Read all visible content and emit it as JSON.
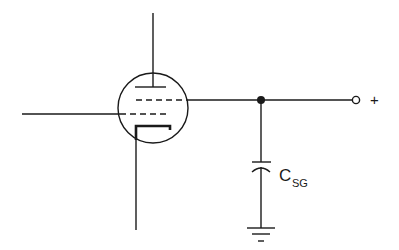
{
  "diagram": {
    "type": "circuit-schematic",
    "components": [
      {
        "id": "tube",
        "kind": "vacuum-tube-tetrode",
        "elements": [
          "plate",
          "screen-grid",
          "control-grid",
          "cathode"
        ]
      },
      {
        "id": "csg",
        "kind": "capacitor",
        "label": "C",
        "label_subscript": "SG"
      },
      {
        "id": "gnd",
        "kind": "ground"
      },
      {
        "id": "junction",
        "kind": "node-dot"
      },
      {
        "id": "terminal",
        "kind": "open-terminal",
        "label": "+"
      }
    ],
    "labels": {
      "capacitor_main": "C",
      "capacitor_sub": "SG",
      "terminal_sign": "+"
    },
    "colors": {
      "ink": "#1a1a1a",
      "background": "#ffffff"
    }
  }
}
